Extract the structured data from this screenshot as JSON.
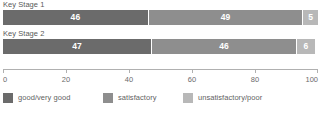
{
  "chart_data": {
    "type": "bar",
    "orientation": "horizontal",
    "stacked": true,
    "title": "",
    "xlabel": "",
    "ylabel": "",
    "xlim": [
      0,
      100
    ],
    "grid": false,
    "legend_position": "bottom",
    "categories": [
      "Key Stage 1",
      "Key Stage 2"
    ],
    "tick_labels": [
      "0",
      "20",
      "40",
      "60",
      "80",
      "100"
    ],
    "tick_values": [
      0,
      20,
      40,
      60,
      80,
      100
    ],
    "series": [
      {
        "name": "good/very good",
        "color": "#6b6b6b",
        "values": [
          46,
          47
        ]
      },
      {
        "name": "satisfactory",
        "color": "#8e8e8e",
        "values": [
          49,
          46
        ]
      },
      {
        "name": "unsatisfactory/poor",
        "color": "#b8b8b8",
        "values": [
          5,
          6
        ]
      }
    ]
  },
  "footnote": ""
}
